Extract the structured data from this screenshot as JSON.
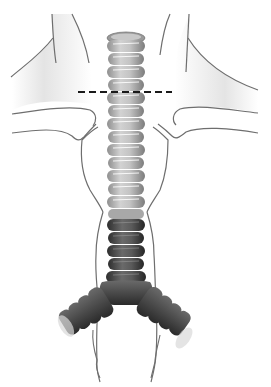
{
  "figure": {
    "view": "anterior",
    "labels": [],
    "annotation": {
      "type": "dashed-line",
      "y": 92,
      "x_start": 78,
      "x_end": 172,
      "color": "#1a1a1a"
    },
    "trachea": {
      "x_left": 107,
      "x_right": 145,
      "top_y": 30,
      "carina_y": 290,
      "ring_count": 21,
      "upper_color": "#b8b8b8",
      "lower_color": "#4a4a4a"
    },
    "outline_color": "#6e6e6e",
    "shading_color": "#e6e6e6"
  }
}
